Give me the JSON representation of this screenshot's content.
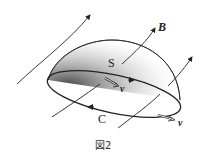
{
  "figure": {
    "caption": "図2",
    "labels": {
      "field": "B",
      "surface": "S",
      "curve": "C",
      "velocity_1": "v",
      "velocity_2": "v"
    },
    "colors": {
      "stroke": "#222222",
      "background": "#ffffff"
    }
  }
}
